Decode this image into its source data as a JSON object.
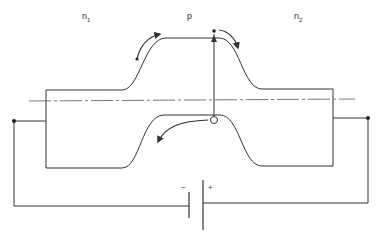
{
  "diagram": {
    "title": "",
    "regions": [
      {
        "id": "n1",
        "label": "n",
        "subscript": "1"
      },
      {
        "id": "p",
        "label": "p",
        "subscript": ""
      },
      {
        "id": "n2",
        "label": "n",
        "subscript": "2"
      }
    ],
    "battery": {
      "negative_label": "−",
      "positive_label": "+"
    },
    "colors": {
      "line": "#333333",
      "background": "#ffffff"
    },
    "elements": [
      "conduction-band-edge",
      "valence-band-edge",
      "fermi-level-dash-dot-line",
      "electron-dot",
      "hole-circle",
      "electron-flow-arrows",
      "hole-flow-arrow",
      "external-circuit-wires",
      "battery"
    ]
  }
}
